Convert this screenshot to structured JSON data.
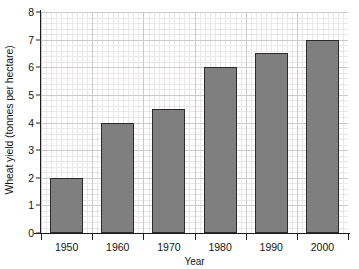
{
  "chart_data": {
    "type": "bar",
    "title": "",
    "xlabel": "Year",
    "ylabel": "Wheat yield (tonnes per hectare)",
    "categories": [
      "1950",
      "1960",
      "1970",
      "1980",
      "1990",
      "2000"
    ],
    "values": [
      2,
      4,
      4.5,
      6,
      6.5,
      7
    ],
    "series": [
      {
        "name": "Wheat yield",
        "values": [
          2,
          4,
          4.5,
          6,
          6.5,
          7
        ]
      }
    ],
    "ylim": [
      0,
      8
    ],
    "yticks": [
      "0",
      "1",
      "2",
      "3",
      "4",
      "5",
      "6",
      "7",
      "8"
    ],
    "ytick_values": [
      0,
      1,
      2,
      3,
      4,
      5,
      6,
      7,
      8
    ],
    "grid": "major and minor gridlines on both axes",
    "legend": "none",
    "bar_color": "#7f7f7f",
    "bar_edge_color": "#2b2b2b",
    "grid_major_color": "#c9c9cf",
    "grid_minor_color": "#eae6ea",
    "axis_color": "#1d1d1d",
    "background_color": "#ffffff"
  }
}
